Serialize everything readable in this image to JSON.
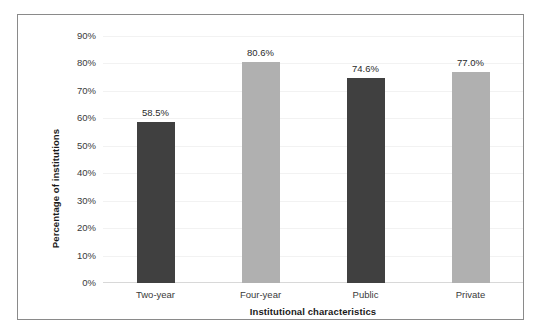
{
  "chart_data": {
    "type": "bar",
    "title": "",
    "xlabel": "Institutional characteristics",
    "ylabel": "Percentage of institutions",
    "categories": [
      "Two-year",
      "Four-year",
      "Public",
      "Private"
    ],
    "values": [
      58.5,
      80.6,
      74.6,
      77.0
    ],
    "data_labels": [
      "58.5%",
      "80.6%",
      "74.6%",
      "77.0%"
    ],
    "ylim": [
      0,
      90
    ],
    "ytick_labels": [
      "90%",
      "80%",
      "70%",
      "60%",
      "50%",
      "40%",
      "30%",
      "20%",
      "10%",
      "0%"
    ],
    "ytick_values": [
      90,
      80,
      70,
      60,
      50,
      40,
      30,
      20,
      10,
      0
    ],
    "grid": true,
    "legend": "none",
    "bar_colors": [
      "#404040",
      "#b0b0b0",
      "#404040",
      "#b0b0b0"
    ],
    "colors": {
      "bar_dark": "#404040",
      "bar_light": "#b0b0b0",
      "gridline": "#f2f2f2",
      "frame": "#8a8a8a",
      "text": "#1a1a1a",
      "background": "#ffffff"
    }
  }
}
